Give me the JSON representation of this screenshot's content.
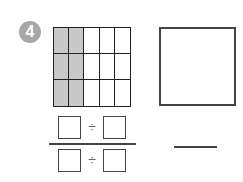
{
  "problem": {
    "number": "4",
    "badge_color": "#a8a8a8",
    "grid": {
      "rows": 3,
      "cols": 5,
      "shaded_cols": 2,
      "shade_color": "#c8c8c8"
    },
    "expression": {
      "numerator": {
        "left_box": "",
        "operator": "÷",
        "right_box": ""
      },
      "denominator": {
        "left_box": "",
        "operator": "÷",
        "right_box": ""
      }
    },
    "answer_square": "",
    "answer_line": ""
  }
}
